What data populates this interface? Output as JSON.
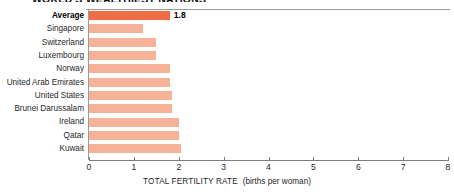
{
  "chart_data": {
    "type": "bar",
    "orientation": "horizontal",
    "title": "WORLD'S WEALTHIEST NATIONS",
    "subtitle": "",
    "xlabel": "TOTAL FERTILITY RATE",
    "xlabel_units": "(births per woman)",
    "ylabel": "",
    "xlim": [
      0,
      8
    ],
    "xticks": [
      "0",
      "1",
      "2",
      "3",
      "4",
      "5",
      "6",
      "7",
      "8"
    ],
    "xtick_values": [
      0,
      1,
      2,
      3,
      4,
      5,
      6,
      7,
      8
    ],
    "grid": false,
    "legend": "none",
    "categories": [
      "Average",
      "Singapore",
      "Switzerland",
      "Luxembourg",
      "Norway",
      "United Arab Emirates",
      "United States",
      "Brunei Darussalam",
      "Ireland",
      "Qatar",
      "Kuwait"
    ],
    "values": [
      1.8,
      1.2,
      1.5,
      1.5,
      1.8,
      1.8,
      1.85,
      1.85,
      2.0,
      2.0,
      2.05
    ],
    "data_labels": [
      "1.8",
      "",
      "",
      "",
      "",
      "",
      "",
      "",
      "",
      "",
      ""
    ],
    "highlight_category": "Average",
    "colors": {
      "bar": "#f6b296",
      "bar_highlight": "#ef6d45",
      "axis": "#7d7d7d",
      "text": "#1f1f1f"
    }
  }
}
